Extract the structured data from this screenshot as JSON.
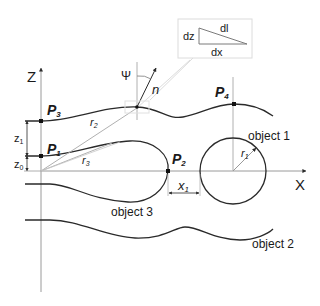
{
  "diagram": {
    "axes": {
      "z_label": "Z",
      "x_label": "X"
    },
    "points": {
      "p1": {
        "base": "P",
        "sub": "1"
      },
      "p2": {
        "base": "P",
        "sub": "2"
      },
      "p3": {
        "base": "P",
        "sub": "3"
      },
      "p4": {
        "base": "P",
        "sub": "4"
      }
    },
    "radii": {
      "r1": {
        "base": "r",
        "sub": "1"
      },
      "r2": {
        "base": "r",
        "sub": "2"
      },
      "r3": {
        "base": "r",
        "sub": "3"
      }
    },
    "dimensions": {
      "z0": {
        "base": "z",
        "sub": "0"
      },
      "z1": {
        "base": "z",
        "sub": "1"
      },
      "x1": {
        "base": "x",
        "sub": "1"
      }
    },
    "angle_label": "Ψ",
    "normal_label": "n",
    "inset": {
      "dz": "dz",
      "dl": "dl",
      "dx": "dx"
    },
    "objects": {
      "object1": "object 1",
      "object2": "object 2",
      "object3": "object 3"
    },
    "colors": {
      "stroke": "#2a2a2a",
      "thin": "#9a9a9a",
      "inset_border": "#dcdcdc"
    }
  }
}
